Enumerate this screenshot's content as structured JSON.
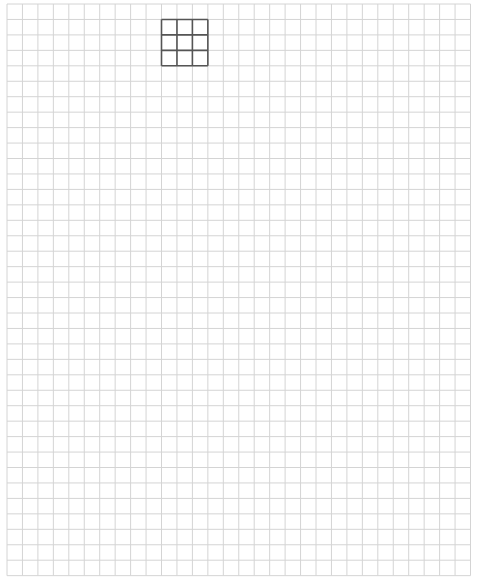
{
  "canvas": {
    "width": 478,
    "height": 588,
    "background": "#ffffff"
  },
  "grid": {
    "origin_x": 7,
    "origin_y": 4,
    "cell_size": 15.45,
    "columns": 30,
    "rows": 37,
    "line_color": "#d4d4d4",
    "line_width": 1
  },
  "highlight_box": {
    "col": 10,
    "row": 1,
    "cols": 3,
    "rows": 3,
    "line_color": "#555555",
    "line_width": 1.6
  }
}
